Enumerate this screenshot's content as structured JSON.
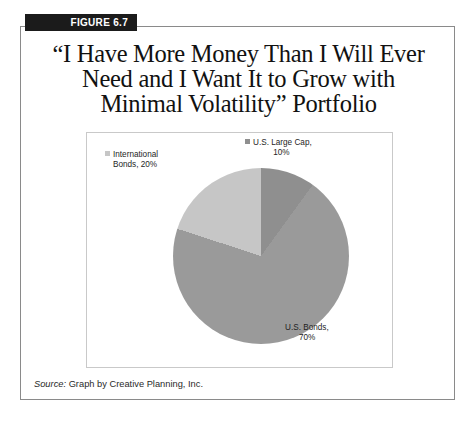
{
  "figure": {
    "tab_label": "FIGURE 6.7",
    "title_lines": [
      "“I Have More Money Than I Will Ever",
      "Need and I Want It to Grow with",
      "Minimal Volatility” Portfolio"
    ],
    "source_prefix": "Source:",
    "source_text": "Graph by Creative Planning, Inc."
  },
  "chart_data": {
    "type": "pie",
    "title": "“I Have More Money Than I Will Ever Need and I Want It to Grow with Minimal Volatility” Portfolio",
    "categories": [
      "U.S. Large Cap",
      "U.S. Bonds",
      "International Bonds"
    ],
    "values": [
      10,
      70,
      20
    ],
    "value_suffix": "%",
    "colors": [
      "#8f8f8f",
      "#9a9a9a",
      "#c6c6c6"
    ],
    "start_angle_deg": 0,
    "direction": "clockwise",
    "legend": "labels-outside",
    "grid": false,
    "labels": [
      {
        "name": "U.S. Large Cap",
        "line1": "U.S. Large Cap,",
        "line2": "10%",
        "value": 10,
        "color": "#8f8f8f"
      },
      {
        "name": "U.S. Bonds",
        "line1": "U.S. Bonds,",
        "line2": "70%",
        "value": 70,
        "color": "#9a9a9a"
      },
      {
        "name": "International Bonds",
        "line1": "International",
        "line2": "Bonds, 20%",
        "value": 20,
        "color": "#c6c6c6"
      }
    ]
  }
}
